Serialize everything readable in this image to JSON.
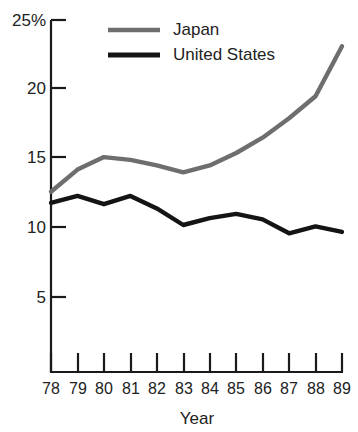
{
  "chart_data": {
    "type": "line",
    "title": "",
    "xlabel": "Year",
    "ylabel": "",
    "x": [
      78,
      79,
      80,
      81,
      82,
      83,
      84,
      85,
      86,
      87,
      88,
      89
    ],
    "categories": [
      "78",
      "79",
      "80",
      "81",
      "82",
      "83",
      "84",
      "85",
      "86",
      "87",
      "88",
      "89"
    ],
    "series": [
      {
        "name": "Japan",
        "color": "#6e6e6e",
        "values": [
          12.6,
          14.2,
          15.1,
          14.9,
          14.5,
          14.0,
          14.5,
          15.4,
          16.5,
          17.9,
          19.5,
          23.1
        ]
      },
      {
        "name": "United States",
        "color": "#141414",
        "values": [
          11.8,
          12.3,
          11.7,
          12.3,
          11.4,
          10.2,
          10.7,
          11.0,
          10.6,
          9.6,
          10.1,
          9.7
        ]
      }
    ],
    "ylim": [
      0,
      25
    ],
    "xlim": [
      78,
      89
    ],
    "yticks": [
      5,
      10,
      15,
      20,
      25
    ],
    "ytick_labels": [
      "5",
      "10",
      "15",
      "20",
      "25%"
    ],
    "grid": false,
    "legend_position": "top-right",
    "legend": [
      {
        "label": "Japan",
        "color": "#6e6e6e"
      },
      {
        "label": "United States",
        "color": "#141414"
      }
    ]
  },
  "axes": {
    "y_tick_5": "5",
    "y_tick_10": "10",
    "y_tick_15": "15",
    "y_tick_20": "20",
    "y_tick_25": "25%",
    "x_tick_78": "78",
    "x_tick_79": "79",
    "x_tick_80": "80",
    "x_tick_81": "81",
    "x_tick_82": "82",
    "x_tick_83": "83",
    "x_tick_84": "84",
    "x_tick_85": "85",
    "x_tick_86": "86",
    "x_tick_87": "87",
    "x_tick_88": "88",
    "x_tick_89": "89",
    "x_axis_title": "Year"
  },
  "legend": {
    "japan_label": "Japan",
    "united_states_label": "United States"
  }
}
